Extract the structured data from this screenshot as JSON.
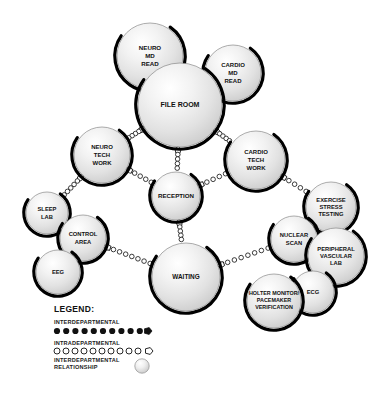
{
  "diagram": {
    "type": "node-link-bubble-diagram",
    "background_color": "#ffffff",
    "node_fill_color": "#e8e8e8",
    "node_highlight_color": "#fafafa",
    "node_outline_color": "#000000",
    "link_color": "#1a1a1a"
  },
  "nodes": [
    {
      "id": "neuro-md-read",
      "label": "NEURO\nMD\nREAD",
      "cx": 150,
      "cy": 56,
      "r": 33,
      "font": 6.2
    },
    {
      "id": "cardio-md-read",
      "label": "CARDIO\nMD\nREAD",
      "cx": 233,
      "cy": 73,
      "r": 28,
      "font": 6.0
    },
    {
      "id": "file-room",
      "label": "FILE ROOM",
      "cx": 180,
      "cy": 105,
      "r": 42,
      "font": 7.0
    },
    {
      "id": "neuro-tech-work",
      "label": "NEURO\nTECH\nWORK",
      "cx": 102,
      "cy": 155,
      "r": 28,
      "font": 6.0
    },
    {
      "id": "cardio-tech-work",
      "label": "CARDIO\nTECH\nWORK",
      "cx": 256,
      "cy": 160,
      "r": 29,
      "font": 6.0
    },
    {
      "id": "reception",
      "label": "RECEPTION",
      "cx": 176,
      "cy": 196,
      "r": 24,
      "font": 6.2
    },
    {
      "id": "sleep-lab",
      "label": "SLEEP\nLAB",
      "cx": 47,
      "cy": 213,
      "r": 21,
      "font": 5.8
    },
    {
      "id": "control-area",
      "label": "CONTROL\nAREA",
      "cx": 83,
      "cy": 238,
      "r": 23,
      "font": 5.8
    },
    {
      "id": "eeg",
      "label": "EEG",
      "cx": 58,
      "cy": 272,
      "r": 22,
      "font": 5.8
    },
    {
      "id": "waiting",
      "label": "WAITING",
      "cx": 186,
      "cy": 277,
      "r": 34,
      "font": 6.4
    },
    {
      "id": "exercise-stress-testing",
      "label": "EXERCISE\nSTRESS\nTESTING",
      "cx": 331,
      "cy": 207,
      "r": 25,
      "font": 5.8
    },
    {
      "id": "nuclear-scan",
      "label": "NUCLEAR\nSCAN",
      "cx": 294,
      "cy": 239,
      "r": 23,
      "font": 5.8
    },
    {
      "id": "peripheral-vascular-lab",
      "label": "PERIPHERAL\nVASCULAR\nLAB",
      "cx": 336,
      "cy": 256,
      "r": 28,
      "font": 5.8
    },
    {
      "id": "ecg",
      "label": "ECG",
      "cx": 313,
      "cy": 292,
      "r": 21,
      "font": 5.8
    },
    {
      "id": "holter-monitor-pacemaker",
      "label": "HOLTER MONITOR/\nPACEMAKER\nVERIFICATION",
      "cx": 274,
      "cy": 301,
      "r": 27,
      "font": 5.4
    }
  ],
  "links": [
    {
      "id": "file-room--neuro-tech-work",
      "from": "file-room",
      "to": "neuro-tech-work",
      "style": "intradepartmental",
      "dots": 4
    },
    {
      "id": "file-room--reception",
      "from": "file-room",
      "to": "reception",
      "style": "intradepartmental",
      "dots": 4
    },
    {
      "id": "file-room--cardio-tech-work",
      "from": "file-room",
      "to": "cardio-tech-work",
      "style": "intradepartmental",
      "dots": 4
    },
    {
      "id": "neuro-tech-work--reception",
      "from": "neuro-tech-work",
      "to": "reception",
      "style": "intradepartmental",
      "dots": 4
    },
    {
      "id": "neuro-tech-work--sleep-lab",
      "from": "neuro-tech-work",
      "to": "sleep-lab",
      "style": "intradepartmental",
      "dots": 5
    },
    {
      "id": "reception--cardio-tech-work",
      "from": "reception",
      "to": "cardio-tech-work",
      "style": "intradepartmental",
      "dots": 4
    },
    {
      "id": "reception--waiting",
      "from": "reception",
      "to": "waiting",
      "style": "intradepartmental",
      "dots": 4
    },
    {
      "id": "cardio-tech-work--exercise",
      "from": "cardio-tech-work",
      "to": "exercise-stress-testing",
      "style": "intradepartmental",
      "dots": 4
    },
    {
      "id": "control-area--waiting",
      "from": "control-area",
      "to": "waiting",
      "style": "intradepartmental",
      "dots": 7
    },
    {
      "id": "waiting--nuclear-scan",
      "from": "waiting",
      "to": "nuclear-scan",
      "style": "intradepartmental",
      "dots": 7
    }
  ],
  "legend": {
    "title": "LEGEND:",
    "items": [
      {
        "id": "interdepartmental",
        "label": "INTERDEPARTMENTAL",
        "symbol": "filled-dots"
      },
      {
        "id": "intradepartmental",
        "label": "INTRADEPARTMENTAL",
        "symbol": "open-circles"
      },
      {
        "id": "interdepartmental-relationship",
        "label": "INTERDEPARTMENTAL\nRELATIONSHIP",
        "symbol": "sphere"
      }
    ]
  }
}
